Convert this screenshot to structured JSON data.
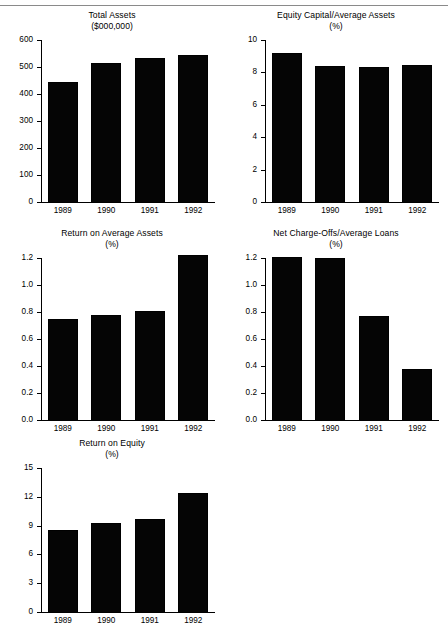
{
  "page": {
    "top_rule": true,
    "background_color": "#ffffff",
    "bar_color": "#050505",
    "axis_color": "#000000"
  },
  "chart_data": [
    {
      "id": "total-assets",
      "type": "bar",
      "title": "Total Assets",
      "subtitle": "($000,000)",
      "xlabel": "",
      "ylabel": "",
      "categories": [
        "1989",
        "1990",
        "1991",
        "1992"
      ],
      "values": [
        443,
        513,
        533,
        543
      ],
      "ylim": [
        0,
        600
      ],
      "yticks": [
        0,
        100,
        200,
        300,
        400,
        500,
        600
      ],
      "ytick_labels": [
        "0",
        "100",
        "200",
        "300",
        "400",
        "500",
        "600"
      ],
      "grid": false,
      "legend": "none"
    },
    {
      "id": "equity-capital-average-assets",
      "type": "bar",
      "title": "Equity Capital/Average Assets",
      "subtitle": "(%)",
      "xlabel": "",
      "ylabel": "",
      "categories": [
        "1989",
        "1990",
        "1991",
        "1992"
      ],
      "values": [
        9.2,
        8.4,
        8.35,
        8.45
      ],
      "ylim": [
        0,
        10
      ],
      "yticks": [
        0,
        2,
        4,
        6,
        8,
        10
      ],
      "ytick_labels": [
        "0",
        "2",
        "4",
        "6",
        "8",
        "10"
      ],
      "grid": false,
      "legend": "none"
    },
    {
      "id": "return-on-average-assets",
      "type": "bar",
      "title": "Return on Average Assets",
      "subtitle": "(%)",
      "xlabel": "",
      "ylabel": "",
      "categories": [
        "1989",
        "1990",
        "1991",
        "1992"
      ],
      "values": [
        0.75,
        0.78,
        0.81,
        1.22
      ],
      "ylim": [
        0.0,
        1.2
      ],
      "yticks": [
        0.0,
        0.2,
        0.4,
        0.6,
        0.8,
        1.0,
        1.2
      ],
      "ytick_labels": [
        "0.0",
        "0.2",
        "0.4",
        "0.6",
        "0.8",
        "1.0",
        "1.2"
      ],
      "grid": false,
      "legend": "none"
    },
    {
      "id": "net-charge-offs-average-loans",
      "type": "bar",
      "title": "Net Charge-Offs/Average Loans",
      "subtitle": "(%)",
      "xlabel": "",
      "ylabel": "",
      "categories": [
        "1989",
        "1990",
        "1991",
        "1992"
      ],
      "values": [
        1.21,
        1.2,
        0.77,
        0.38
      ],
      "ylim": [
        0.0,
        1.2
      ],
      "yticks": [
        0.0,
        0.2,
        0.4,
        0.6,
        0.8,
        1.0,
        1.2
      ],
      "ytick_labels": [
        "0.0",
        "0.2",
        "0.4",
        "0.6",
        "0.8",
        "1.0",
        "1.2"
      ],
      "grid": false,
      "legend": "none"
    },
    {
      "id": "return-on-equity",
      "type": "bar",
      "title": "Return on Equity",
      "subtitle": "(%)",
      "xlabel": "",
      "ylabel": "",
      "categories": [
        "1989",
        "1990",
        "1991",
        "1992"
      ],
      "values": [
        8.5,
        9.3,
        9.7,
        12.4
      ],
      "ylim": [
        0,
        15
      ],
      "yticks": [
        0,
        3,
        6,
        9,
        12,
        15
      ],
      "ytick_labels": [
        "0",
        "3",
        "6",
        "9",
        "12",
        "15"
      ],
      "grid": false,
      "legend": "none"
    }
  ],
  "layout": {
    "panels": [
      {
        "id": "total-assets",
        "left": 0,
        "top": 10,
        "width": 224,
        "height": 210
      },
      {
        "id": "equity-capital-average-assets",
        "left": 224,
        "top": 10,
        "width": 224,
        "height": 210
      },
      {
        "id": "return-on-average-assets",
        "left": 0,
        "top": 228,
        "width": 224,
        "height": 210
      },
      {
        "id": "net-charge-offs-average-loans",
        "left": 224,
        "top": 228,
        "width": 224,
        "height": 210
      },
      {
        "id": "return-on-equity",
        "left": 0,
        "top": 438,
        "width": 224,
        "height": 192
      }
    ]
  }
}
